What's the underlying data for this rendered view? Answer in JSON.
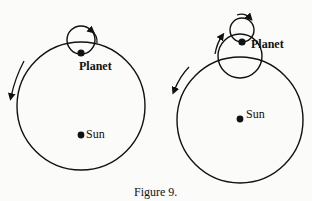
{
  "figure": {
    "caption": "Figure 9.",
    "colors": {
      "ink": "#111111",
      "paper": "#fbfbf9"
    },
    "left_diagram": {
      "description": "Planet on a single epicycle riding a deferent around the Sun",
      "planet_label": "Planet",
      "sun_label": "Sun",
      "deferent_motion": "counterclockwise",
      "epicycle_motion": "clockwise"
    },
    "right_diagram": {
      "description": "Planet on an epicycle mounted on a second epicycle riding a deferent around the Sun",
      "planet_label": "Planet",
      "sun_label": "Sun",
      "deferent_motion": "counterclockwise",
      "epicycle_motion": "clockwise",
      "second_epicycle_motion": "clockwise"
    }
  }
}
